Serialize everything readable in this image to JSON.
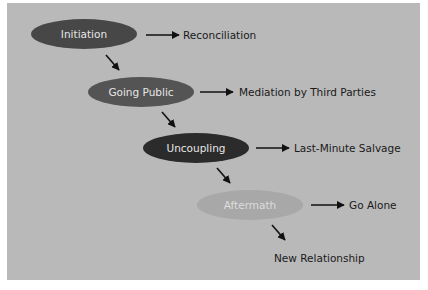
{
  "diagram": {
    "background": "#b9b9b9",
    "stages": [
      {
        "id": "initiation",
        "label": "Initiation",
        "color": "#474747",
        "text_color": "#e8e8e8",
        "cx": 84,
        "cy": 34,
        "outcome": "Reconciliation"
      },
      {
        "id": "going-public",
        "label": "Going Public",
        "color": "#545454",
        "text_color": "#e8e8e8",
        "cx": 141,
        "cy": 92,
        "outcome": "Mediation by Third Parties"
      },
      {
        "id": "uncoupling",
        "label": "Uncoupling",
        "color": "#2b2b2b",
        "text_color": "#e8e8e8",
        "cx": 196,
        "cy": 148,
        "outcome": "Last-Minute Salvage"
      },
      {
        "id": "aftermath",
        "label": "Aftermath",
        "color": "#a8a8a8",
        "text_color": "#dcdcdc",
        "cx": 250,
        "cy": 205,
        "outcome": "Go Alone"
      }
    ],
    "final_outcome": "New Relationship"
  }
}
